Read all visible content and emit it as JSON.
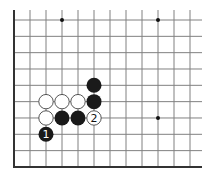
{
  "diagram": {
    "type": "go-board-fragment",
    "edges": [
      "left",
      "bottom"
    ],
    "columns": 12,
    "rows": 10,
    "colors": {
      "line": "#808080",
      "edge": "#333333",
      "black_stone": "#1a1a1a",
      "white_stone": "#ffffff",
      "white_outline": "#444444",
      "background": "#ffffff"
    },
    "star_points": [
      {
        "col": 3,
        "row": 0
      },
      {
        "col": 9,
        "row": 0
      },
      {
        "col": 9,
        "row": 6
      }
    ],
    "stones": [
      {
        "color": "black",
        "col": 5,
        "row": 4,
        "label": ""
      },
      {
        "color": "black",
        "col": 5,
        "row": 5,
        "label": ""
      },
      {
        "color": "white",
        "col": 2,
        "row": 5,
        "label": ""
      },
      {
        "color": "white",
        "col": 3,
        "row": 5,
        "label": ""
      },
      {
        "color": "white",
        "col": 4,
        "row": 5,
        "label": ""
      },
      {
        "color": "white",
        "col": 2,
        "row": 6,
        "label": ""
      },
      {
        "color": "black",
        "col": 3,
        "row": 6,
        "label": ""
      },
      {
        "color": "black",
        "col": 4,
        "row": 6,
        "label": ""
      },
      {
        "color": "white",
        "col": 5,
        "row": 6,
        "label": "2"
      },
      {
        "color": "black",
        "col": 2,
        "row": 7,
        "label": "1"
      }
    ]
  }
}
